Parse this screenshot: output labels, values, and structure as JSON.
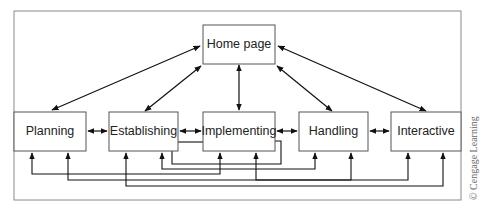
{
  "diagram": {
    "type": "website navigation structure",
    "nodes": {
      "home": {
        "label": "Home page"
      },
      "planning": {
        "label": "Planning"
      },
      "establishing": {
        "label": "Establishing"
      },
      "implementing": {
        "label": "Implementing"
      },
      "handling": {
        "label": "Handling"
      },
      "interactive": {
        "label": "Interactive"
      }
    },
    "edges": [
      {
        "from": "home",
        "to": "planning",
        "bidirectional": true
      },
      {
        "from": "home",
        "to": "establishing",
        "bidirectional": true
      },
      {
        "from": "home",
        "to": "implementing",
        "bidirectional": true
      },
      {
        "from": "home",
        "to": "handling",
        "bidirectional": true
      },
      {
        "from": "home",
        "to": "interactive",
        "bidirectional": true
      },
      {
        "from": "planning",
        "to": "establishing",
        "bidirectional": true
      },
      {
        "from": "establishing",
        "to": "implementing",
        "bidirectional": true
      },
      {
        "from": "implementing",
        "to": "handling",
        "bidirectional": true
      },
      {
        "from": "handling",
        "to": "interactive",
        "bidirectional": true
      },
      {
        "from": "establishing",
        "to": "implementing",
        "bidirectional": false,
        "routing": "bottom"
      },
      {
        "from": "establishing",
        "to": "handling",
        "bidirectional": false,
        "routing": "bottom"
      },
      {
        "from": "planning",
        "to": "implementing",
        "bidirectional": false,
        "routing": "bottom"
      },
      {
        "from": "planning",
        "to": "handling",
        "bidirectional": false,
        "routing": "bottom"
      },
      {
        "from": "implementing",
        "to": "interactive",
        "bidirectional": false,
        "routing": "bottom"
      },
      {
        "from": "establishing",
        "to": "interactive",
        "bidirectional": false,
        "routing": "bottom"
      }
    ],
    "credit": "© Cengage Learning",
    "colors": {
      "line": "#1a1a1a",
      "box_border": "#555555",
      "frame": "#888888"
    }
  }
}
